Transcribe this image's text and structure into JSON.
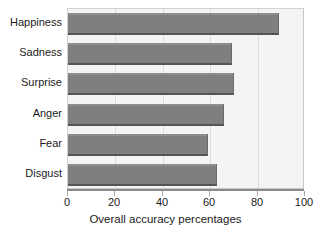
{
  "chart_data": {
    "type": "bar",
    "orientation": "horizontal",
    "title": "",
    "subtitle": "",
    "categories": [
      "Happiness",
      "Sadness",
      "Surprise",
      "Anger",
      "Fear",
      "Disgust"
    ],
    "values": [
      89,
      69,
      70,
      66,
      59,
      63
    ],
    "xlabel": "Overall accuracy percentages",
    "ylabel": "",
    "xlim": [
      0,
      100
    ],
    "xticks": [
      0,
      20,
      40,
      60,
      80,
      100
    ],
    "xtick_labels": [
      "0",
      "20",
      "40",
      "60",
      "80",
      "100"
    ],
    "grid": true,
    "grid_axis": "x",
    "legend": false,
    "legend_position": "none",
    "annotations": [],
    "colors": {
      "bar_fill": "#7f7f80",
      "bar_shadow": "#555557",
      "plot_background": "#f4f4f4",
      "frame_border": "#c9c9c9",
      "gridline": "#dcdcdc",
      "axis_line": "#8a8a8a",
      "text": "#1a1a1a",
      "page_background": "#ffffff"
    }
  }
}
